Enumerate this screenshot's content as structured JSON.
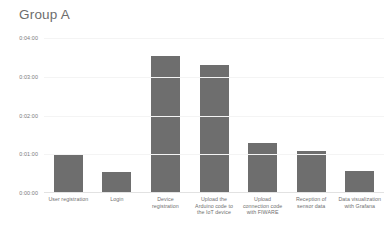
{
  "chart_data": {
    "type": "bar",
    "title": "Group A",
    "xlabel": "",
    "ylabel": "",
    "categories": [
      "User registration",
      "Login",
      "Device registration",
      "Upload the Arduino code to the IoT device",
      "Upload connection code with FIWARE",
      "Reception of sensor data",
      "Data visualization with Grafana"
    ],
    "values": [
      59,
      33,
      212,
      198,
      77,
      65,
      34
    ],
    "value_labels": [
      "0:00:59",
      "0:00:33",
      "0:03:32",
      "0:03:18",
      "0:01:17",
      "0:01:05",
      "0:00:34"
    ],
    "ytick_labels": [
      "0:04:00",
      "0:03:00",
      "0:02:00",
      "0:01:00",
      "0:00:00"
    ],
    "ytick_values": [
      240,
      180,
      120,
      60,
      0
    ],
    "ylim": [
      0,
      240
    ],
    "unit": "seconds",
    "grid": true,
    "legend": false,
    "series": [
      {
        "name": "Group A",
        "values": [
          59,
          33,
          212,
          198,
          77,
          65,
          34
        ]
      }
    ],
    "colors": {
      "bar": "#6e6e6e",
      "grid": "#f4f4f4",
      "axis": "#e2e2e2",
      "title_text": "#6d6d6d",
      "tick_text": "#7a7a7a",
      "background": "#ffffff"
    }
  }
}
